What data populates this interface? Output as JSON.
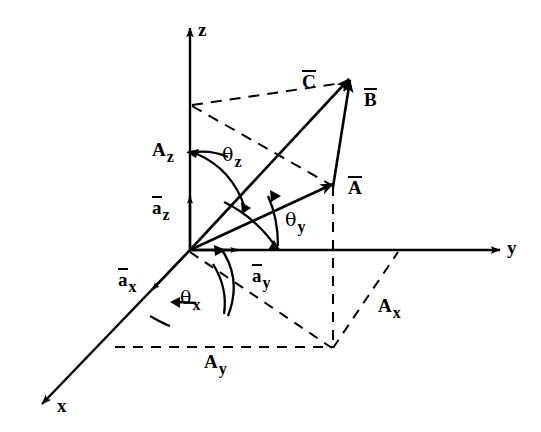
{
  "figure": {
    "type": "vector-diagram",
    "background_color": "#ffffff",
    "ink_color": "#000000"
  },
  "axes": [
    {
      "name": "z-axis",
      "label": "z",
      "direction": "up"
    },
    {
      "name": "y-axis",
      "label": "y",
      "direction": "right"
    },
    {
      "name": "x-axis",
      "label": "x",
      "direction": "lower-left"
    }
  ],
  "vectors": [
    {
      "name": "vector-A",
      "label": "A",
      "overbar": true
    },
    {
      "name": "vector-B",
      "label": "B",
      "overbar": true
    },
    {
      "name": "vector-C",
      "label": "C",
      "overbar": true
    }
  ],
  "unit_vectors": [
    {
      "name": "unit-vector-ax",
      "base": "a",
      "sub": "x",
      "overbar": true
    },
    {
      "name": "unit-vector-ay",
      "base": "a",
      "sub": "y",
      "overbar": true
    },
    {
      "name": "unit-vector-az",
      "base": "a",
      "sub": "z",
      "overbar": true
    }
  ],
  "components": [
    {
      "name": "component-Ax",
      "base": "A",
      "sub": "x",
      "overbar": false
    },
    {
      "name": "component-Ay",
      "base": "A",
      "sub": "y",
      "overbar": false
    },
    {
      "name": "component-Az",
      "base": "A",
      "sub": "z",
      "overbar": false
    }
  ],
  "angles": [
    {
      "name": "angle-theta-x",
      "base": "θ",
      "sub": "x"
    },
    {
      "name": "angle-theta-y",
      "base": "θ",
      "sub": "y"
    },
    {
      "name": "angle-theta-z",
      "base": "θ",
      "sub": "z"
    }
  ],
  "labels": {
    "axis_z": "z",
    "axis_y": "y",
    "axis_x": "x",
    "vector_a": "A",
    "vector_b": "B",
    "vector_c": "C",
    "unit_a": "a",
    "comp_a": "A",
    "theta": "θ",
    "sub_x": "x",
    "sub_y": "y",
    "sub_z": "z"
  }
}
